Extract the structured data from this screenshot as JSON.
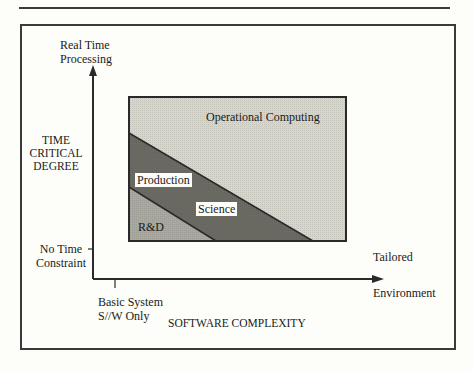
{
  "y_axis": {
    "top_label_line1": "Real Time",
    "top_label_line2": "Processing",
    "title_line1": "TIME",
    "title_line2": "CRITICAL",
    "title_line3": "DEGREE",
    "bottom_label_line1": "No Time",
    "bottom_label_line2": "Constraint"
  },
  "x_axis": {
    "left_label_line1": "Basic System",
    "left_label_line2": "S//W Only",
    "title": "SOFTWARE COMPLEXITY",
    "right_label_line1": "Tailored",
    "right_label_line2": "Environment"
  },
  "regions": {
    "operational": {
      "label": "Operational Computing",
      "color": "#d6d6cc"
    },
    "science": {
      "label": "Science",
      "color": "#6b6b63"
    },
    "production": {
      "label": "Production"
    },
    "rnd": {
      "label": "R&D",
      "color": "#a9a9a1"
    }
  },
  "colors": {
    "line": "#2a2a2a",
    "background": "#fdfdf9"
  }
}
